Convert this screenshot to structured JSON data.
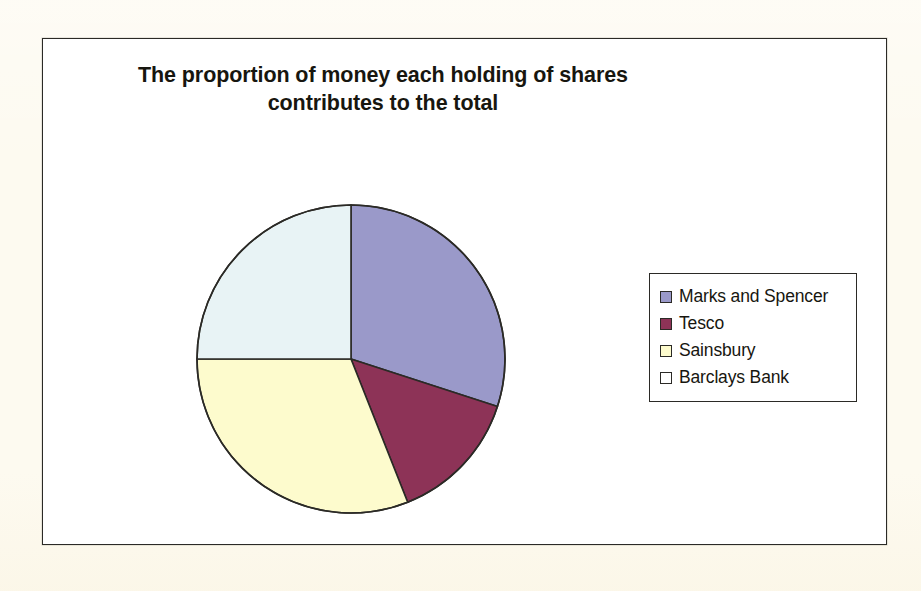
{
  "chart_data": {
    "type": "pie",
    "title": "The proportion of money each holding of shares contributes to the total",
    "title_lines": [
      "The proportion of money each holding of shares",
      "contributes to the total"
    ],
    "categories": [
      "Marks and Spencer",
      "Tesco",
      "Sainsbury",
      "Barclays Bank"
    ],
    "values": [
      30,
      14,
      31,
      25
    ],
    "value_unit": "percent",
    "start_angle_deg": 0,
    "direction": "clockwise",
    "slice_angles_deg": [
      108,
      51,
      111,
      90
    ],
    "colors": [
      "#9a99c9",
      "#8d3357",
      "#fdfbcd",
      "#e8f3f5"
    ],
    "slice_border_color": "#2b2a26",
    "legend": {
      "position": "right",
      "entries": [
        {
          "label": "Marks and Spencer",
          "color": "#9a99c9"
        },
        {
          "label": "Tesco",
          "color": "#8d3357"
        },
        {
          "label": "Sainsbury",
          "color": "#fdfbcd"
        },
        {
          "label": "Barclays Bank",
          "color": "#ffffff"
        }
      ]
    },
    "grid": false,
    "xlabel": "",
    "ylabel": ""
  },
  "page": {
    "background_color": "#fdfaf0",
    "frame_color": "#2b2a26",
    "plot_background": "#ffffff"
  },
  "bleed_through": {
    "visible": true,
    "lines": [
      "the",
      "work",
      "shares"
    ]
  }
}
